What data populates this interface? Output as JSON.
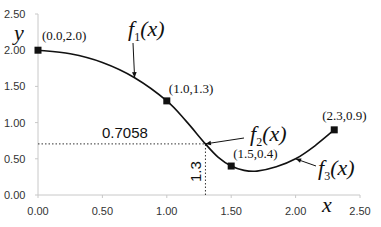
{
  "chart_data": {
    "type": "line",
    "title": "",
    "xlabel": "x",
    "ylabel": "y",
    "xlim": [
      0,
      2.5
    ],
    "ylim": [
      0,
      2.5
    ],
    "x_ticks": [
      "0.00",
      "0.50",
      "1.00",
      "1.50",
      "2.00",
      "2.50"
    ],
    "y_ticks": [
      "0.00",
      "0.50",
      "1.00",
      "1.50",
      "2.00",
      "2.50"
    ],
    "grid": false,
    "legend": "none",
    "series": [
      {
        "name": "spline f1,f2,f3",
        "points": [
          [
            0.0,
            2.0
          ],
          [
            1.0,
            1.3
          ],
          [
            1.5,
            0.4
          ],
          [
            2.3,
            0.9
          ]
        ]
      }
    ],
    "curve_samples": [
      [
        0.0,
        2.0
      ],
      [
        0.25,
        1.95
      ],
      [
        0.5,
        1.83
      ],
      [
        0.75,
        1.62
      ],
      [
        1.0,
        1.3
      ],
      [
        1.15,
        1.02
      ],
      [
        1.3,
        0.7058
      ],
      [
        1.4,
        0.52
      ],
      [
        1.5,
        0.4
      ],
      [
        1.6,
        0.34
      ],
      [
        1.7,
        0.33
      ],
      [
        1.85,
        0.39
      ],
      [
        2.0,
        0.5
      ],
      [
        2.15,
        0.68
      ],
      [
        2.3,
        0.9
      ]
    ],
    "markers": [
      {
        "x": 0.0,
        "y": 2.0,
        "label": "(0.0,2.0)"
      },
      {
        "x": 1.0,
        "y": 1.3,
        "label": "(1.0,1.3)"
      },
      {
        "x": 1.5,
        "y": 0.4,
        "label": "(1.5,0.4)"
      },
      {
        "x": 2.3,
        "y": 0.9,
        "label": "(2.3,0.9)"
      }
    ],
    "function_labels": [
      {
        "name": "f",
        "sub": "1",
        "arg": "(x)",
        "points_to": [
          0.75,
          1.62
        ]
      },
      {
        "name": "f",
        "sub": "2",
        "arg": "(x)",
        "points_to": [
          1.3,
          0.7058
        ]
      },
      {
        "name": "f",
        "sub": "3",
        "arg": "(x)",
        "points_to": [
          2.0,
          0.5
        ]
      }
    ],
    "annotations": [
      {
        "text": "0.7058",
        "type": "horizontal-dotted",
        "y": 0.7058,
        "x_from": 0.0,
        "x_to": 1.3
      },
      {
        "text": "1.3",
        "type": "vertical-dotted",
        "x": 1.3,
        "y_from": 0.0,
        "y_to": 0.7058,
        "rotated": true
      }
    ]
  },
  "colors": {
    "curve": "#111111",
    "axis": "#c8c8c8",
    "marker": "#111111",
    "text": "#333333"
  }
}
